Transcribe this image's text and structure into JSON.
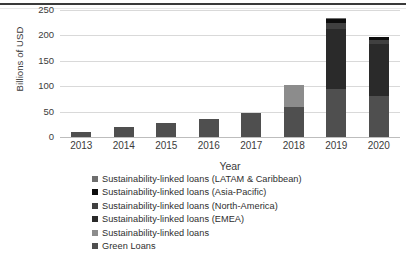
{
  "chart_data": {
    "type": "bar",
    "stacked": true,
    "title": "",
    "xlabel": "Year",
    "ylabel": "Billions of USD",
    "categories": [
      "2013",
      "2014",
      "2015",
      "2016",
      "2017",
      "2018",
      "2019",
      "2020"
    ],
    "yticks": [
      "0",
      "50",
      "100",
      "150",
      "200",
      "250"
    ],
    "ylim": [
      0,
      250
    ],
    "grid": true,
    "legend_position": "bottom",
    "series": [
      {
        "name": "Green Loans",
        "color": "#4f4f4f",
        "values": [
          10,
          20,
          28,
          36,
          48,
          60,
          95,
          80
        ]
      },
      {
        "name": "Sustainability-linked loans",
        "color": "#8c8c8c",
        "values": [
          0,
          0,
          0,
          0,
          0,
          42,
          0,
          0
        ]
      },
      {
        "name": "Sustainability-linked loans (EMEA)",
        "color": "#2a2a2a",
        "values": [
          0,
          0,
          0,
          0,
          0,
          0,
          117,
          103
        ]
      },
      {
        "name": "Sustainability-linked loans (North-America)",
        "color": "#404040",
        "values": [
          0,
          0,
          0,
          0,
          0,
          0,
          12,
          8
        ]
      },
      {
        "name": "Sustainability-linked loans (Asia-Pacific)",
        "color": "#0d0d0d",
        "values": [
          0,
          0,
          0,
          0,
          0,
          0,
          9,
          5
        ]
      },
      {
        "name": "Sustainability-linked loans (LATAM & Caribbean)",
        "color": "#6e6e6e",
        "values": [
          0,
          0,
          0,
          0,
          0,
          0,
          2,
          1
        ]
      }
    ],
    "totals": [
      10,
      20,
      28,
      36,
      48,
      102,
      235,
      197
    ]
  },
  "axis": {
    "y_title": "Billions of USD",
    "x_title": "Year",
    "y_ticks": [
      "250",
      "200",
      "150",
      "100",
      "50",
      "0"
    ],
    "x_ticks": [
      "2013",
      "2014",
      "2015",
      "2016",
      "2017",
      "2018",
      "2019",
      "2020"
    ]
  },
  "legend": {
    "items": [
      {
        "label": "Sustainability-linked loans (LATAM & Caribbean)",
        "color": "#6e6e6e"
      },
      {
        "label": "Sustainability-linked loans (Asia-Pacific)",
        "color": "#0d0d0d"
      },
      {
        "label": "Sustainability-linked loans (North-America)",
        "color": "#404040"
      },
      {
        "label": "Sustainability-linked loans (EMEA)",
        "color": "#2a2a2a"
      },
      {
        "label": "Sustainability-linked loans",
        "color": "#8c8c8c"
      },
      {
        "label": "Green Loans",
        "color": "#4f4f4f"
      }
    ]
  }
}
